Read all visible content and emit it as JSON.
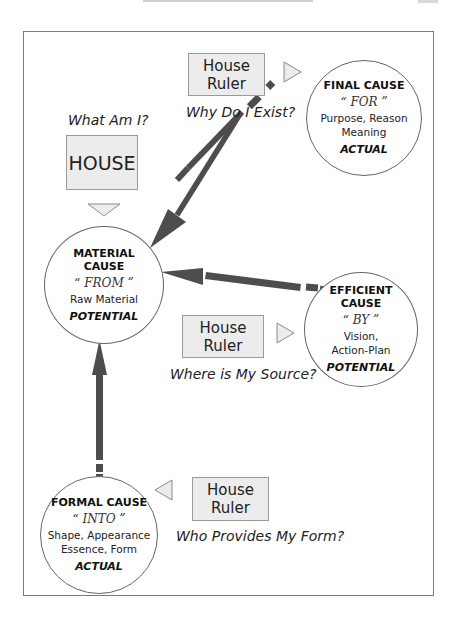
{
  "diagram": {
    "colors": {
      "arrow": "#4d4d4d",
      "box_fill": "#ececec",
      "box_border": "#9a9a9a",
      "frame_border": "#7a7a7a"
    },
    "subject": {
      "question": "What Am I?",
      "label": "HOUSE"
    },
    "final_group": {
      "ruler_line1": "House",
      "ruler_line2": "Ruler",
      "question": "Why Do I Exist?"
    },
    "efficient_group": {
      "ruler_line1": "House",
      "ruler_line2": "Ruler",
      "question": "Where is My Source?"
    },
    "formal_group": {
      "ruler_line1": "House",
      "ruler_line2": "Ruler",
      "question": "Who Provides My Form?"
    },
    "causes": {
      "material": {
        "title_line1": "MATERIAL",
        "title_line2": "CAUSE",
        "preposition": "“ FROM ”",
        "description_line1": "Raw Material",
        "state": "POTENTIAL"
      },
      "final": {
        "title_line1": "FINAL CAUSE",
        "preposition": "“ FOR ”",
        "description_line1": "Purpose, Reason",
        "description_line2": "Meaning",
        "state": "ACTUAL"
      },
      "efficient": {
        "title_line1": "EFFICIENT",
        "title_line2": "CAUSE",
        "preposition": "“ BY ”",
        "description_line1": "Vision,",
        "description_line2": "Action-Plan",
        "state": "POTENTIAL"
      },
      "formal": {
        "title_line1": "FORMAL CAUSE",
        "preposition": "“ INTO ”",
        "description_line1": "Shape, Appearance",
        "description_line2": "Essence, Form",
        "state": "ACTUAL"
      }
    },
    "arrows": [
      {
        "from": "final",
        "to": "material",
        "style": "dashed-tail solid-head"
      },
      {
        "from": "efficient",
        "to": "material",
        "style": "dashed-tail solid-head"
      },
      {
        "from": "formal",
        "to": "material",
        "style": "dashed-tail solid-head"
      }
    ]
  }
}
